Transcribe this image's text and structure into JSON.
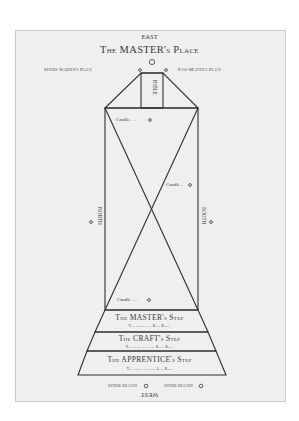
{
  "diagram": {
    "directions": {
      "east": "EAST",
      "west": "WEST",
      "north": "NORTH",
      "south": "SOUTH"
    },
    "master_place": "The MASTER's Place",
    "senior_warden_place": "Senior Warden's Place",
    "past_master_place": "Pass-Master's Place",
    "bible": "BIBLE",
    "candles": [
      "Candle . . .",
      "Candle .",
      "Candle . . ."
    ],
    "steps": [
      {
        "title": "The MASTER's Step",
        "subtitle": "You kneel with Both Knees"
      },
      {
        "title": "The CRAFT's Step",
        "subtitle": "You kneel with the Right Knee"
      },
      {
        "title": "The APPRENTICE's Step",
        "subtitle": "You kneel with the Left Knee"
      }
    ],
    "deacons": {
      "senior": "Senior Deacon",
      "junior": "Junior Deacon"
    },
    "colors": {
      "panel": "#efefef",
      "line": "#2e2e2e",
      "text": "#3a3a3a"
    }
  }
}
